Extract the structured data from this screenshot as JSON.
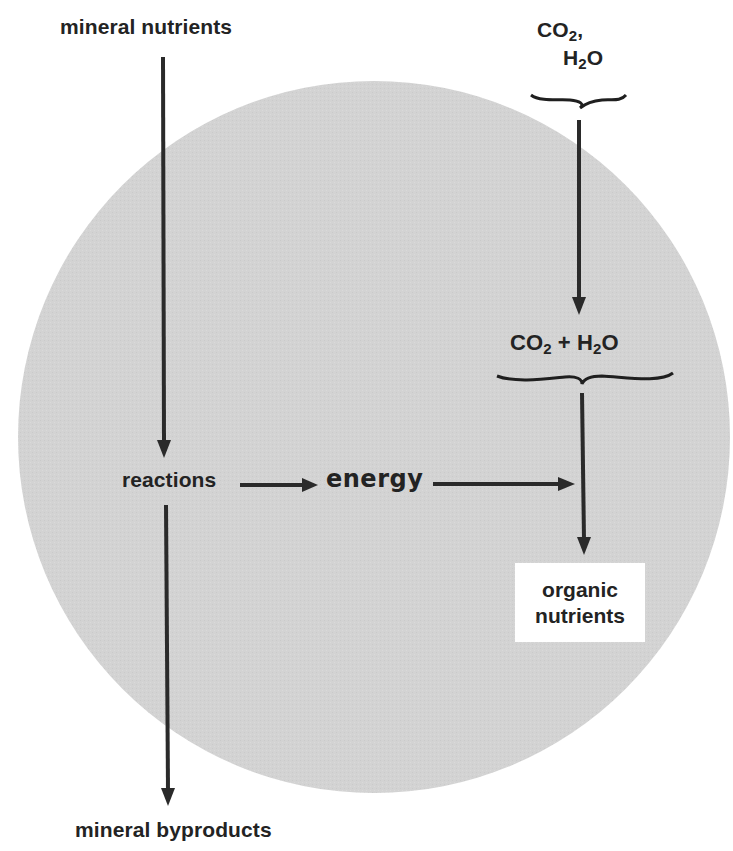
{
  "diagram": {
    "type": "flow-diagram",
    "colors": {
      "background": "#ffffff",
      "circle_fill": "#d2d2d2",
      "text": "#232323",
      "arrow": "#2a2a2a",
      "box_fill": "#ffffff"
    },
    "labels": {
      "mineral_nutrients": "mineral nutrients",
      "co2_top": "CO",
      "co2_top_sub": "2",
      "co2_top_comma": ",",
      "h2o_top_h": "H",
      "h2o_top_sub": "2",
      "h2o_top_o": "O",
      "mid_co2": "CO",
      "mid_co2_sub": "2",
      "mid_plus": " + ",
      "mid_h": "H",
      "mid_h_sub": "2",
      "mid_o": "O",
      "reactions": "reactions",
      "energy": "energy",
      "organic_line1": "organic",
      "organic_line2": "nutrients",
      "mineral_byproducts": "mineral byproducts"
    },
    "nodes": [
      {
        "id": "mineral-nutrients",
        "text": "mineral nutrients",
        "position": "top-left, outside circle"
      },
      {
        "id": "co2-h2o-inputs",
        "text": "CO2, H2O",
        "position": "top-right, outside circle"
      },
      {
        "id": "co2-plus-h2o",
        "text": "CO2 + H2O",
        "position": "inside circle, right"
      },
      {
        "id": "reactions",
        "text": "reactions",
        "position": "inside circle, left"
      },
      {
        "id": "energy",
        "text": "energy",
        "position": "inside circle, center"
      },
      {
        "id": "organic-nutrients",
        "text": "organic nutrients",
        "position": "inside circle, right, boxed"
      },
      {
        "id": "mineral-byproducts",
        "text": "mineral byproducts",
        "position": "bottom-left, outside circle"
      }
    ],
    "edges": [
      {
        "from": "mineral-nutrients",
        "to": "reactions"
      },
      {
        "from": "reactions",
        "to": "mineral-byproducts"
      },
      {
        "from": "reactions",
        "to": "energy"
      },
      {
        "from": "energy",
        "to": "organic-nutrients",
        "note": "joins CO2+H2O arrow"
      },
      {
        "from": "co2-h2o-inputs",
        "to": "co2-plus-h2o"
      },
      {
        "from": "co2-plus-h2o",
        "to": "organic-nutrients"
      }
    ]
  }
}
